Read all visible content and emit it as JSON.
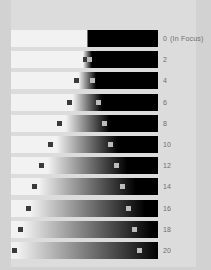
{
  "colors": {
    "background": "#d2d2d2",
    "panel": "#dcdcdc",
    "bar_light": "#f2f2f2",
    "bar_dark": "#000000",
    "marker_dark": "#3a3a3a",
    "marker_light": "#bdbdbd",
    "label_text": "#6e6e6e"
  },
  "labels": {
    "focus_note": "(In Focus)",
    "units": ""
  },
  "chart_data": {
    "type": "bar",
    "xlabel": "",
    "ylabel": "Defocus step",
    "grid": false,
    "legend": "none",
    "categories": [
      "0",
      "2",
      "4",
      "6",
      "8",
      "10",
      "12",
      "14",
      "16",
      "18",
      "20"
    ],
    "series": [
      {
        "name": "edge_transition_center_pct",
        "values": [
          52,
          52,
          52,
          52,
          52,
          52,
          52,
          52,
          52,
          52,
          52
        ]
      },
      {
        "name": "blur_width_pct",
        "values": [
          1,
          6,
          12,
          20,
          30,
          42,
          54,
          66,
          78,
          88,
          96
        ]
      },
      {
        "name": "marker_dark_pos_pct",
        "values": [
          null,
          49,
          43,
          38,
          31,
          25,
          19,
          14,
          10,
          5,
          1
        ]
      },
      {
        "name": "marker_light_pos_pct",
        "values": [
          null,
          52,
          54,
          58,
          62,
          66,
          70,
          74,
          78,
          82,
          86
        ]
      }
    ],
    "rows": [
      {
        "label": "0",
        "note": "(In Focus)",
        "blur": 1,
        "center": 52,
        "marker_dark": null,
        "marker_light": null
      },
      {
        "label": "2",
        "note": "",
        "blur": 6,
        "center": 52,
        "marker_dark": 49,
        "marker_light": 52
      },
      {
        "label": "4",
        "note": "",
        "blur": 12,
        "center": 52,
        "marker_dark": 43,
        "marker_light": 54
      },
      {
        "label": "6",
        "note": "",
        "blur": 20,
        "center": 52,
        "marker_dark": 38,
        "marker_light": 58
      },
      {
        "label": "8",
        "note": "",
        "blur": 30,
        "center": 52,
        "marker_dark": 31,
        "marker_light": 62
      },
      {
        "label": "10",
        "note": "",
        "blur": 42,
        "center": 52,
        "marker_dark": 25,
        "marker_light": 66
      },
      {
        "label": "12",
        "note": "",
        "blur": 54,
        "center": 52,
        "marker_dark": 19,
        "marker_light": 70
      },
      {
        "label": "14",
        "note": "",
        "blur": 66,
        "center": 52,
        "marker_dark": 14,
        "marker_light": 74
      },
      {
        "label": "16",
        "note": "",
        "blur": 78,
        "center": 52,
        "marker_dark": 10,
        "marker_light": 78
      },
      {
        "label": "18",
        "note": "",
        "blur": 88,
        "center": 52,
        "marker_dark": 5,
        "marker_light": 82
      },
      {
        "label": "20",
        "note": "",
        "blur": 96,
        "center": 52,
        "marker_dark": 1,
        "marker_light": 86
      }
    ]
  }
}
